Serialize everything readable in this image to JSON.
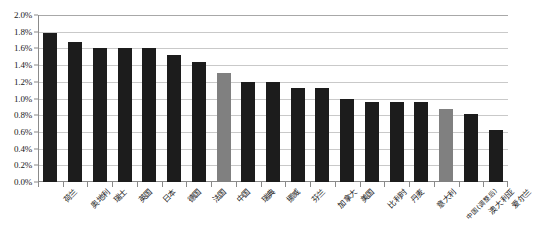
{
  "chart_data": {
    "type": "bar",
    "title": "",
    "subtitle": "",
    "xlabel": "",
    "ylabel": "",
    "ylim": [
      0.0,
      2.0
    ],
    "y_tick_step": 0.2,
    "y_tick_labels": [
      "0.0%",
      "0.2%",
      "0.4%",
      "0.6%",
      "0.8%",
      "1.0%",
      "1.2%",
      "1.4%",
      "1.6%",
      "1.8%",
      "2.0%"
    ],
    "y_tick_values": [
      0.0,
      0.2,
      0.4,
      0.6,
      0.8,
      1.0,
      1.2,
      1.4,
      1.6,
      1.8,
      2.0
    ],
    "value_unit": "percent",
    "grid": true,
    "grid_axis": "y",
    "legend": "none",
    "legend_position": "none",
    "series_name": "",
    "categories": [
      "荷兰",
      "奥地利",
      "瑞士",
      "英国",
      "日本",
      "德国",
      "法国",
      "中国",
      "瑞典",
      "挪威",
      "芬兰",
      "加拿大",
      "美国",
      "比利时",
      "丹麦",
      "意大利",
      "中国(调整后)",
      "澳大利亚",
      "爱尔兰"
    ],
    "values": [
      1.78,
      1.68,
      1.6,
      1.6,
      1.6,
      1.52,
      1.44,
      1.3,
      1.2,
      1.2,
      1.13,
      1.13,
      1.0,
      0.96,
      0.96,
      0.96,
      0.87,
      0.82,
      0.62
    ],
    "bar_colors": [
      "#1c1c1c",
      "#1c1c1c",
      "#1c1c1c",
      "#1c1c1c",
      "#1c1c1c",
      "#1c1c1c",
      "#1c1c1c",
      "#808080",
      "#1c1c1c",
      "#1c1c1c",
      "#1c1c1c",
      "#1c1c1c",
      "#1c1c1c",
      "#1c1c1c",
      "#1c1c1c",
      "#1c1c1c",
      "#808080",
      "#1c1c1c",
      "#1c1c1c"
    ],
    "highlight_indices": [
      7,
      16
    ],
    "colors": {
      "bar_default": "#1c1c1c",
      "bar_highlight": "#808080",
      "gridline": "#c9c9c9",
      "axis": "#8a8a8a",
      "background": "#ffffff",
      "text": "#1a1a1a"
    }
  }
}
